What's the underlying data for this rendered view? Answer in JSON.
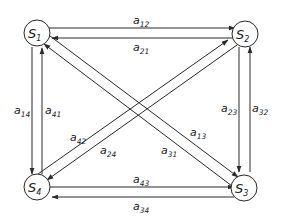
{
  "diagram": {
    "type": "directed-graph",
    "colors": {
      "stroke": "#2a2a2a",
      "text": "#222222",
      "background": "#ffffff"
    },
    "nodes": [
      {
        "id": "S1",
        "base": "S",
        "sub": "1"
      },
      {
        "id": "S2",
        "base": "S",
        "sub": "2"
      },
      {
        "id": "S3",
        "base": "S",
        "sub": "3"
      },
      {
        "id": "S4",
        "base": "S",
        "sub": "4"
      }
    ],
    "edges": [
      {
        "from": "S1",
        "to": "S2",
        "base": "a",
        "sub": "12"
      },
      {
        "from": "S2",
        "to": "S1",
        "base": "a",
        "sub": "21"
      },
      {
        "from": "S1",
        "to": "S4",
        "base": "a",
        "sub": "14"
      },
      {
        "from": "S4",
        "to": "S1",
        "base": "a",
        "sub": "41"
      },
      {
        "from": "S2",
        "to": "S3",
        "base": "a",
        "sub": "23"
      },
      {
        "from": "S3",
        "to": "S2",
        "base": "a",
        "sub": "32"
      },
      {
        "from": "S4",
        "to": "S3",
        "base": "a",
        "sub": "43"
      },
      {
        "from": "S3",
        "to": "S4",
        "base": "a",
        "sub": "34"
      },
      {
        "from": "S1",
        "to": "S3",
        "base": "a",
        "sub": "13"
      },
      {
        "from": "S3",
        "to": "S1",
        "base": "a",
        "sub": "31"
      },
      {
        "from": "S4",
        "to": "S2",
        "base": "a",
        "sub": "42"
      },
      {
        "from": "S2",
        "to": "S4",
        "base": "a",
        "sub": "24"
      }
    ]
  }
}
